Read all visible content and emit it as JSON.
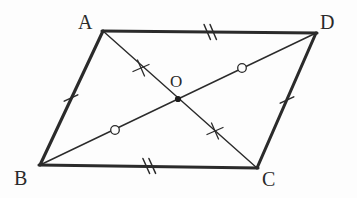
{
  "figure": {
    "kind": "geometry-diagram",
    "shape_name": "parallelogram",
    "background_color": "#fdfdfd",
    "stroke_color": "#2b2b2b",
    "side_stroke_width": 3,
    "diagonal_stroke_width": 1.4,
    "mark_stroke_width": 1.4,
    "width": 357,
    "height": 198
  },
  "vertices": [
    {
      "id": "A",
      "label": "A",
      "x": 103,
      "y": 31,
      "label_x": 78,
      "label_y": 12
    },
    {
      "id": "D",
      "label": "D",
      "x": 316,
      "y": 33,
      "label_x": 320,
      "label_y": 12
    },
    {
      "id": "C",
      "label": "C",
      "x": 257,
      "y": 168,
      "label_x": 262,
      "label_y": 169
    },
    {
      "id": "B",
      "label": "B",
      "x": 40,
      "y": 165,
      "label_x": 14,
      "label_y": 168
    }
  ],
  "center_point": {
    "id": "O",
    "label": "O",
    "x": 178,
    "y": 99,
    "label_x": 170,
    "label_y": 73,
    "dot_radius": 3.1
  },
  "sides": [
    {
      "name": "side-AD",
      "from": "A",
      "to": "D",
      "x1": 103,
      "y1": 31,
      "x2": 316,
      "y2": 33
    },
    {
      "name": "side-DC",
      "from": "D",
      "to": "C",
      "x1": 316,
      "y1": 33,
      "x2": 257,
      "y2": 168
    },
    {
      "name": "side-CB",
      "from": "C",
      "to": "B",
      "x1": 257,
      "y1": 168,
      "x2": 40,
      "y2": 165
    },
    {
      "name": "side-BA",
      "from": "B",
      "to": "A",
      "x1": 40,
      "y1": 165,
      "x2": 103,
      "y2": 31
    }
  ],
  "diagonals": [
    {
      "name": "diagonal-AC",
      "from": "A",
      "to": "C",
      "x1": 103,
      "y1": 31,
      "x2": 257,
      "y2": 168
    },
    {
      "name": "diagonal-BD",
      "from": "B",
      "to": "D",
      "x1": 40,
      "y1": 165,
      "x2": 316,
      "y2": 33
    }
  ],
  "side_marks": [
    {
      "name": "tick-side-AD",
      "glyph": "double-slash",
      "count": 2,
      "x": 207,
      "y": 32,
      "angle": 0.5,
      "length": 15,
      "slant": 22,
      "spacing": 6
    },
    {
      "name": "tick-side-BC",
      "glyph": "double-slash",
      "count": 2,
      "x": 148,
      "y": 166,
      "angle": -0.8,
      "length": 15,
      "slant": 22,
      "spacing": 6
    },
    {
      "name": "tick-side-AB",
      "glyph": "single-slash",
      "count": 1,
      "x": 71,
      "y": 98,
      "angle": 295.0,
      "length": 14,
      "slant": 0,
      "spacing": 0
    },
    {
      "name": "tick-side-DC",
      "glyph": "single-slash",
      "count": 1,
      "x": 287,
      "y": 100,
      "angle": 293.6,
      "length": 14,
      "slant": 0,
      "spacing": 0
    }
  ],
  "diagonal_marks": [
    {
      "name": "cross-mark-AO",
      "glyph": "plus-cross",
      "on": "diagonal-AC",
      "x": 141,
      "y": 68,
      "size": 9
    },
    {
      "name": "cross-mark-OC",
      "glyph": "plus-cross",
      "on": "diagonal-AC",
      "x": 215,
      "y": 131,
      "size": 9
    },
    {
      "name": "circle-mark-BO",
      "glyph": "small-circle",
      "on": "diagonal-BD",
      "x": 115,
      "y": 130,
      "radius": 4.3
    },
    {
      "name": "circle-mark-OD",
      "glyph": "small-circle",
      "on": "diagonal-BD",
      "x": 242,
      "y": 68,
      "radius": 4.3
    }
  ]
}
